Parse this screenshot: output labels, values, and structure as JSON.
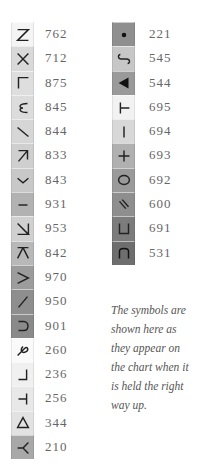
{
  "left_column": [
    {
      "symbol": "z-letter-icon",
      "code": "762",
      "shade": "#f4f4f4"
    },
    {
      "symbol": "x-cross-icon",
      "code": "712",
      "shade": "#d9d9d9"
    },
    {
      "symbol": "corner-bottom-left-icon",
      "code": "875",
      "shade": "#dedede"
    },
    {
      "symbol": "omega-rotated-icon",
      "code": "845",
      "shade": "#dcdcdc"
    },
    {
      "symbol": "backslash-line-icon",
      "code": "844",
      "shade": "#d6d6d6"
    },
    {
      "symbol": "northeast-arrow-icon",
      "code": "833",
      "shade": "#cfcfcf"
    },
    {
      "symbol": "chevron-down-icon",
      "code": "843",
      "shade": "#c8c8c8"
    },
    {
      "symbol": "horizontal-dash-icon",
      "code": "931",
      "shade": "#b2b2b2"
    },
    {
      "symbol": "n-rotated-icon",
      "code": "953",
      "shade": "#d0d0d0"
    },
    {
      "symbol": "k-rotated-icon",
      "code": "842",
      "shade": "#b8b8b8"
    },
    {
      "symbol": "greater-than-icon",
      "code": "970",
      "shade": "#9c9c9c"
    },
    {
      "symbol": "slash-line-icon",
      "code": "950",
      "shade": "#8e8e8e"
    },
    {
      "symbol": "c-rotated-icon",
      "code": "901",
      "shade": "#8a8a8a"
    },
    {
      "symbol": "loop-symbol-icon",
      "code": "260",
      "shade": "#fafafa"
    },
    {
      "symbol": "corner-hook-icon",
      "code": "236",
      "shade": "#f0f0f0"
    },
    {
      "symbol": "t-rotated-icon",
      "code": "256",
      "shade": "#e8e8e8"
    },
    {
      "symbol": "triangle-outline-icon",
      "code": "344",
      "shade": "#e2e2e2"
    },
    {
      "symbol": "y-rotated-icon",
      "code": "210",
      "shade": "#a8a8a8"
    }
  ],
  "right_column": [
    {
      "symbol": "dot-icon",
      "code": "221",
      "shade": "#8f8f8f"
    },
    {
      "symbol": "s-rotated-icon",
      "code": "545",
      "shade": "#c7c7c7"
    },
    {
      "symbol": "triangle-filled-icon",
      "code": "544",
      "shade": "#9a9a9a"
    },
    {
      "symbol": "t-rotated-right-icon",
      "code": "695",
      "shade": "#f2f2f2"
    },
    {
      "symbol": "vertical-bar-icon",
      "code": "694",
      "shade": "#d8d8d8"
    },
    {
      "symbol": "plus-icon",
      "code": "693",
      "shade": "#b0b0b0"
    },
    {
      "symbol": "circle-outline-icon",
      "code": "692",
      "shade": "#9a9a9a"
    },
    {
      "symbol": "double-slash-icon",
      "code": "600",
      "shade": "#8e8e8e"
    },
    {
      "symbol": "u-rotated-icon",
      "code": "691",
      "shade": "#7c7c7c"
    },
    {
      "symbol": "n-arch-icon",
      "code": "531",
      "shade": "#6e6e6e"
    }
  ],
  "note": "The symbols are shown here as they appear on the chart when it is held the right way up."
}
